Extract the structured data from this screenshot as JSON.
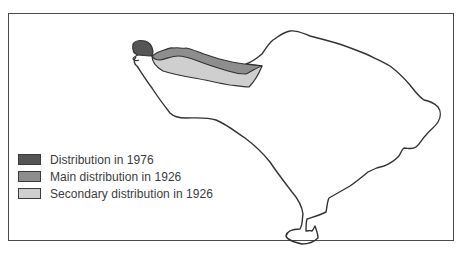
{
  "map": {
    "subject": "island",
    "outline_color": "#333333",
    "frame_color": "#4a4a4a"
  },
  "legend": {
    "items": [
      {
        "label": "Distribution in 1976",
        "color": "#555555"
      },
      {
        "label": "Main distribution in 1926",
        "color": "#8e8e8e"
      },
      {
        "label": "Secondary distribution in 1926",
        "color": "#cfcfcf"
      }
    ]
  }
}
